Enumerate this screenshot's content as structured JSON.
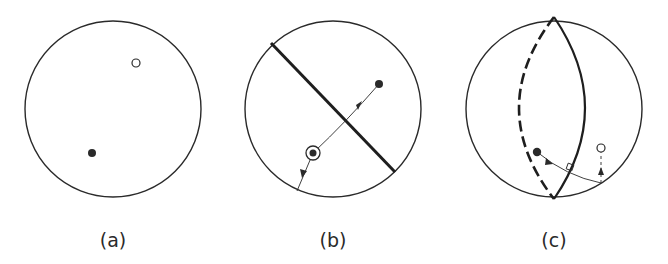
{
  "figure": {
    "panels": [
      {
        "id": "a",
        "label": "(a)",
        "description": "Sphere/circle with an open point and a filled point",
        "elements": [
          "open-point",
          "filled-point"
        ]
      },
      {
        "id": "b",
        "label": "(b)",
        "description": "Circle with a thick diameter line; ringed point projected across the line to a filled point, and another arrow to the circle boundary",
        "elements": [
          "mirror-line",
          "filled-point",
          "ringed-point",
          "reflection-arrow",
          "boundary-arrow"
        ]
      },
      {
        "id": "c",
        "label": "(c)",
        "description": "Sphere with a great-circle plane (solid front arc, dashed back arc); a filled point moved along a path perpendicular to the plane, then up to an open point",
        "elements": [
          "great-circle-solid-arc",
          "great-circle-dashed-arc",
          "filled-point",
          "open-point",
          "perpendicular-path",
          "right-angle-marker",
          "vertical-dashed-arrow"
        ]
      }
    ],
    "colors": {
      "stroke": "#2a2a2a",
      "background": "#ffffff"
    }
  }
}
